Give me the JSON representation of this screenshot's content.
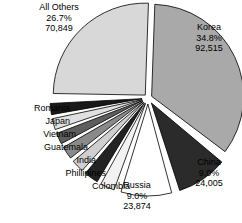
{
  "chart_data": {
    "type": "pie",
    "title": "",
    "subtitle": "",
    "xlabel": "",
    "ylabel": "",
    "legend_position": "none",
    "grid": false,
    "exploded": true,
    "center": {
      "x": 148,
      "y": 98
    },
    "radius": 92,
    "categories": [
      "Korea",
      "China",
      "Russia",
      "Colombia",
      "Phillipines",
      "India",
      "Guatemala",
      "Vietnam",
      "Japan",
      "Romania",
      "All Others"
    ],
    "values": [
      92515,
      24005,
      23874,
      2500,
      2400,
      2300,
      2200,
      2100,
      2000,
      1900,
      70849
    ],
    "percents": [
      34.8,
      9.0,
      9.0,
      1.0,
      0.9,
      0.9,
      0.8,
      0.8,
      0.8,
      0.7,
      26.7
    ],
    "slices": [
      {
        "name": "Korea",
        "percent_text": "34.8%",
        "value_text": "92,515",
        "percent": 34.8,
        "value": 92515,
        "color": "#a9a9a9",
        "start_angle": -88,
        "end_angle": 37,
        "explode": 4,
        "labelled": true
      },
      {
        "name": "China",
        "percent_text": "9.0%",
        "value_text": "24,005",
        "percent": 9.0,
        "value": 24005,
        "color": "#2b2b2b",
        "start_angle": 40,
        "end_angle": 72,
        "explode": 6,
        "labelled": true
      },
      {
        "name": "Russia",
        "percent_text": "9.0%",
        "value_text": "23,874",
        "percent": 9.0,
        "value": 23874,
        "color": "#ffffff",
        "start_angle": 75,
        "end_angle": 107,
        "explode": 6,
        "labelled": true
      },
      {
        "name": "Colombia",
        "percent_text": "",
        "value_text": "",
        "percent": 1.0,
        "value": 2500,
        "color": "#f2f2f2",
        "start_angle": 110,
        "end_angle": 119,
        "explode": 6,
        "labelled": false
      },
      {
        "name": "Phillipines",
        "percent_text": "",
        "value_text": "",
        "percent": 0.9,
        "value": 2400,
        "color": "#232323",
        "start_angle": 121,
        "end_angle": 130,
        "explode": 6,
        "labelled": false
      },
      {
        "name": "India",
        "percent_text": "",
        "value_text": "",
        "percent": 0.9,
        "value": 2300,
        "color": "#cfcfcf",
        "start_angle": 132,
        "end_angle": 140,
        "explode": 6,
        "labelled": false
      },
      {
        "name": "Guatemala",
        "percent_text": "",
        "value_text": "",
        "percent": 0.8,
        "value": 2200,
        "color": "#8a8a8a",
        "start_angle": 142,
        "end_angle": 150,
        "explode": 6,
        "labelled": false
      },
      {
        "name": "Vietnam",
        "percent_text": "",
        "value_text": "",
        "percent": 0.8,
        "value": 2100,
        "color": "#5e5e5e",
        "start_angle": 152,
        "end_angle": 159,
        "explode": 6,
        "labelled": false
      },
      {
        "name": "Japan",
        "percent_text": "",
        "value_text": "",
        "percent": 0.8,
        "value": 2000,
        "color": "#e0e0e0",
        "start_angle": 161,
        "end_angle": 168,
        "explode": 6,
        "labelled": false
      },
      {
        "name": "Romania",
        "percent_text": "",
        "value_text": "",
        "percent": 0.7,
        "value": 1900,
        "color": "#191919",
        "start_angle": 170,
        "end_angle": 177,
        "explode": 6,
        "labelled": false
      },
      {
        "name": "All Others",
        "percent_text": "26.7%",
        "value_text": "70,849",
        "percent": 26.7,
        "value": 70849,
        "color": "#d8d8d8",
        "start_angle": 181,
        "end_angle": 272,
        "explode": 4,
        "labelled": true
      }
    ],
    "stroke_color": "#000000",
    "background": "#ffffff"
  },
  "labels": {
    "all_others": {
      "name": "All Others",
      "percent": "26.7%",
      "value": "70,849"
    },
    "korea": {
      "name": "Korea",
      "percent": "34.8%",
      "value": "92,515"
    },
    "china": {
      "name": "China",
      "percent": "9.0%",
      "value": "24,005"
    },
    "russia": {
      "name": "Russia",
      "percent": "9.0%",
      "value": "23,874"
    },
    "romania": {
      "name": "Romania"
    },
    "japan": {
      "name": "Japan"
    },
    "vietnam": {
      "name": "Vietnam"
    },
    "guatemala": {
      "name": "Guatemala"
    },
    "india": {
      "name": "India"
    },
    "phillipines": {
      "name": "Phillipines"
    },
    "colombia": {
      "name": "Colombia"
    }
  }
}
